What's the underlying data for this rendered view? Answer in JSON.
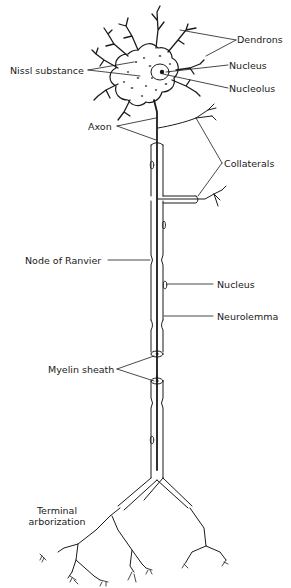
{
  "diagram": {
    "colors": {
      "ink": "#1a1a1a",
      "background": "#ffffff",
      "dots": "#222222"
    },
    "labels": {
      "dendrons": "Dendrons",
      "nissl_substance": "Nissl substance",
      "nucleus_cell": "Nucleus",
      "nucleolus": "Nucleolus",
      "axon": "Axon",
      "collaterals": "Collaterals",
      "node_of_ranvier": "Node of Ranvier",
      "nucleus_sheath": "Nucleus",
      "neurolemma": "Neurolemma",
      "myelin_sheath": "Myelin sheath",
      "terminal_line1": "Terminal",
      "terminal_line2": "arborization"
    }
  }
}
